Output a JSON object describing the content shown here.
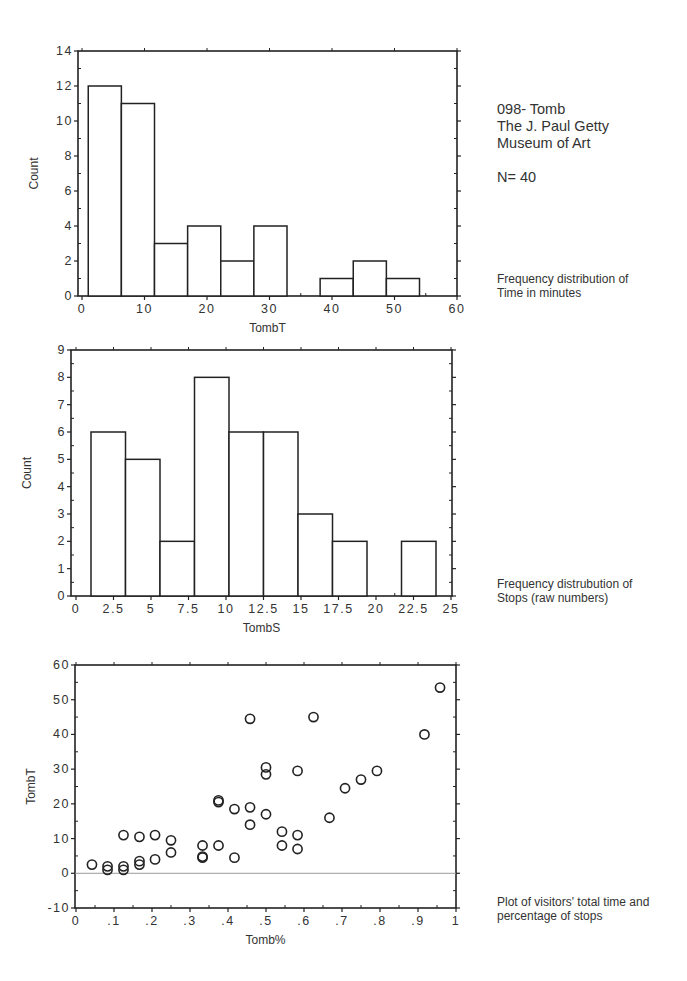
{
  "header": {
    "line1": "098- Tomb",
    "line2": "The J. Paul Getty",
    "line3": "Museum of Art",
    "n_label": "N= 40"
  },
  "notes": {
    "hist1": "Frequency distribution of\nTime in minutes",
    "hist2": "Frequency distrubution of\nStops (raw numbers)",
    "scatter": "Plot of visitors' total time and\npercentage of stops"
  },
  "chart_data": [
    {
      "type": "bar",
      "subtype": "histogram",
      "xlabel": "TombT",
      "ylabel": "Count",
      "xlim": [
        0,
        60
      ],
      "ylim": [
        0,
        14
      ],
      "xticks": [
        "0",
        "10",
        "20",
        "30",
        "40",
        "50",
        "60"
      ],
      "yticks": [
        "0",
        "2",
        "4",
        "6",
        "8",
        "10",
        "12",
        "14"
      ],
      "bin_start": 1,
      "bin_width": 5.3,
      "values": [
        12,
        11,
        3,
        4,
        2,
        4,
        0,
        1,
        2,
        1
      ],
      "grid": false
    },
    {
      "type": "bar",
      "subtype": "histogram",
      "xlabel": "TombS",
      "ylabel": "Count",
      "xlim": [
        0,
        25
      ],
      "ylim": [
        0,
        9
      ],
      "xticks": [
        "0",
        "2.5",
        "5",
        "7.5",
        "10",
        "12.5",
        "15",
        "17.5",
        "20",
        "22.5",
        "25"
      ],
      "yticks": [
        "0",
        "1",
        "2",
        "3",
        "4",
        "5",
        "6",
        "7",
        "8",
        "9"
      ],
      "bin_start": 1,
      "bin_width": 2.3,
      "values": [
        6,
        5,
        2,
        8,
        6,
        6,
        3,
        2,
        0,
        2
      ],
      "grid": false
    },
    {
      "type": "scatter",
      "xlabel": "Tomb%",
      "ylabel": "TombT",
      "xlim": [
        0,
        1
      ],
      "ylim": [
        -10,
        60
      ],
      "xticks": [
        "0",
        ".1",
        ".2",
        ".3",
        ".4",
        ".5",
        ".6",
        ".7",
        ".8",
        ".9",
        "1"
      ],
      "yticks": [
        "-10",
        "0",
        "10",
        "20",
        "30",
        "40",
        "50",
        "60"
      ],
      "reference_line_y": 0,
      "points": [
        [
          0.042,
          2.5
        ],
        [
          0.083,
          2
        ],
        [
          0.083,
          1
        ],
        [
          0.125,
          2
        ],
        [
          0.125,
          1
        ],
        [
          0.125,
          11
        ],
        [
          0.167,
          3.5
        ],
        [
          0.167,
          2.5
        ],
        [
          0.167,
          10.5
        ],
        [
          0.208,
          4
        ],
        [
          0.208,
          11
        ],
        [
          0.25,
          6
        ],
        [
          0.25,
          9.5
        ],
        [
          0.333,
          8
        ],
        [
          0.333,
          4.5
        ],
        [
          0.333,
          4.8
        ],
        [
          0.375,
          8
        ],
        [
          0.375,
          21
        ],
        [
          0.375,
          20.5
        ],
        [
          0.417,
          18.5
        ],
        [
          0.417,
          4.5
        ],
        [
          0.458,
          44.5
        ],
        [
          0.458,
          19
        ],
        [
          0.458,
          14
        ],
        [
          0.5,
          30.5
        ],
        [
          0.5,
          28.5
        ],
        [
          0.5,
          17
        ],
        [
          0.542,
          12
        ],
        [
          0.542,
          8
        ],
        [
          0.583,
          29.5
        ],
        [
          0.583,
          11
        ],
        [
          0.583,
          7
        ],
        [
          0.625,
          45
        ],
        [
          0.667,
          16
        ],
        [
          0.708,
          24.5
        ],
        [
          0.75,
          27
        ],
        [
          0.792,
          29.5
        ],
        [
          0.917,
          40
        ],
        [
          0.958,
          53.5
        ]
      ],
      "grid": false
    }
  ]
}
